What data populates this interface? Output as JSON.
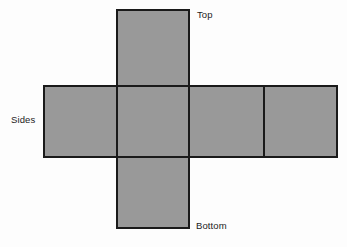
{
  "figure": {
    "name": "cube-net-diagram",
    "background_color": "#fdfdfd",
    "face_fill_color": "#999999",
    "stroke_color": "#1a1a1a",
    "stroke_width": 2,
    "labels": {
      "top": "Top",
      "sides": "Sides",
      "bottom": "Bottom"
    },
    "geometry": {
      "viewbox": [
        0,
        0,
        347,
        247
      ],
      "vertical_strip": {
        "x": 117,
        "y": 10,
        "width": 72,
        "height": 218
      },
      "horizontal_band": {
        "x": 44,
        "y": 86,
        "width": 293,
        "height": 71
      },
      "band_dividers_x": [
        189,
        264
      ],
      "faces": [
        {
          "id": "top-face",
          "x": 117,
          "y": 10,
          "width": 72,
          "height": 76
        },
        {
          "id": "side-face-1",
          "x": 44,
          "y": 86,
          "width": 73,
          "height": 71
        },
        {
          "id": "side-face-2",
          "x": 117,
          "y": 86,
          "width": 72,
          "height": 71
        },
        {
          "id": "side-face-3",
          "x": 189,
          "y": 86,
          "width": 75,
          "height": 71
        },
        {
          "id": "side-face-4",
          "x": 264,
          "y": 86,
          "width": 73,
          "height": 71
        },
        {
          "id": "bottom-face",
          "x": 117,
          "y": 157,
          "width": 72,
          "height": 71
        }
      ]
    }
  }
}
